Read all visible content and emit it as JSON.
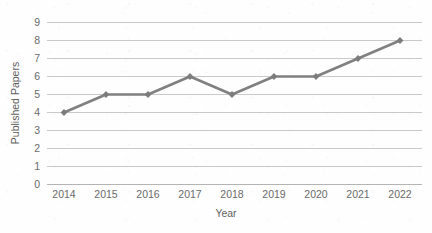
{
  "chart_data": {
    "type": "line",
    "title": "",
    "xlabel": "Year",
    "ylabel": "Published Papers",
    "categories": [
      "2014",
      "2015",
      "2016",
      "2017",
      "2018",
      "2019",
      "2020",
      "2021",
      "2022"
    ],
    "x": [
      2014,
      2015,
      2016,
      2017,
      2018,
      2019,
      2020,
      2021,
      2022
    ],
    "values": [
      4,
      5,
      5,
      6,
      5,
      6,
      6,
      7,
      8
    ],
    "series": [
      {
        "name": "Published Papers",
        "values": [
          4,
          5,
          5,
          6,
          5,
          6,
          6,
          7,
          8
        ]
      }
    ],
    "ylim": [
      0,
      9
    ],
    "yticks": [
      0,
      1,
      2,
      3,
      4,
      5,
      6,
      7,
      8,
      9
    ],
    "ytick_labels": [
      "0",
      "1",
      "2",
      "3",
      "4",
      "5",
      "6",
      "7",
      "8",
      "9"
    ],
    "xtick_labels": [
      "2014",
      "2015",
      "2016",
      "2017",
      "2018",
      "2019",
      "2020",
      "2021",
      "2022"
    ],
    "grid": "horizontal",
    "legend": "none",
    "marker": "diamond",
    "colors": {
      "line": "#808080",
      "marker": "#7c7c7c",
      "gridline": "#c9c9c9",
      "axis": "#b4b4b4",
      "tick_text": "#6a6a6a",
      "axis_title": "#5f5f5f",
      "background": "#fefefe"
    }
  }
}
